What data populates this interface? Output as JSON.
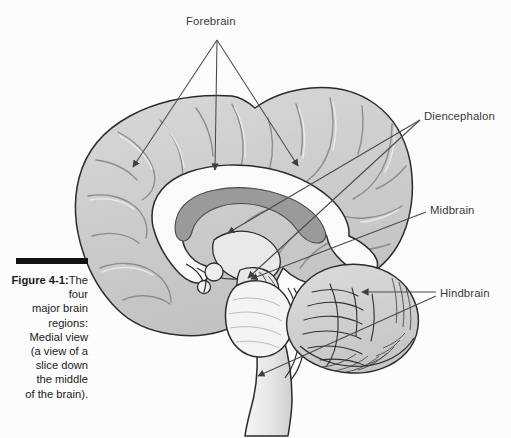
{
  "figure": {
    "caption_label": "Figure 4-1:",
    "caption_body": "The four\nmajor brain\nregions:\nMedial view\n(a view of a\nslice down\nthe middle\nof the brain)."
  },
  "labels": {
    "forebrain": "Forebrain",
    "diencephalon": "Diencephalon",
    "midbrain": "Midbrain",
    "hindbrain": "Hindbrain"
  },
  "colors": {
    "page_background": "#fcfcfc",
    "cortex_fill": "#cfcfcf",
    "cortex_fill_light": "#dcdcdc",
    "white_matter": "#fafafa",
    "ventricle": "#9a9a9a",
    "outline": "#2b2b2b",
    "sulcus": "#8a8a8a",
    "leader_line": "#4a4a4a",
    "caption_rule": "#111111",
    "label_text": "#3a3a3a"
  },
  "anatomy": {
    "regions": [
      {
        "name": "cerebral-cortex",
        "belongs_to": "Forebrain"
      },
      {
        "name": "corpus-callosum",
        "belongs_to": "Forebrain"
      },
      {
        "name": "lateral-ventricle",
        "belongs_to": "Forebrain"
      },
      {
        "name": "thalamus",
        "belongs_to": "Diencephalon"
      },
      {
        "name": "hypothalamus",
        "belongs_to": "Diencephalon"
      },
      {
        "name": "midbrain-tectum",
        "belongs_to": "Midbrain"
      },
      {
        "name": "cerebellum",
        "belongs_to": "Hindbrain"
      },
      {
        "name": "pons",
        "belongs_to": "Hindbrain"
      },
      {
        "name": "medulla-oblongata",
        "belongs_to": "Hindbrain"
      }
    ],
    "leaders": [
      {
        "label": "Forebrain",
        "from": [
          217,
          40
        ],
        "to": [
          133,
          167
        ]
      },
      {
        "label": "Forebrain",
        "from": [
          217,
          40
        ],
        "to": [
          215,
          170
        ]
      },
      {
        "label": "Forebrain",
        "from": [
          217,
          40
        ],
        "to": [
          298,
          166
        ]
      },
      {
        "label": "Diencephalon",
        "from": [
          420,
          120
        ],
        "to": [
          228,
          233
        ]
      },
      {
        "label": "Diencephalon",
        "from": [
          420,
          120
        ],
        "to": [
          248,
          278
        ]
      },
      {
        "label": "Midbrain",
        "from": [
          426,
          212
        ],
        "to": [
          251,
          279
        ]
      },
      {
        "label": "Hindbrain",
        "from": [
          436,
          292
        ],
        "to": [
          362,
          292
        ]
      },
      {
        "label": "Hindbrain",
        "from": [
          436,
          296
        ],
        "to": [
          258,
          376
        ]
      }
    ]
  }
}
